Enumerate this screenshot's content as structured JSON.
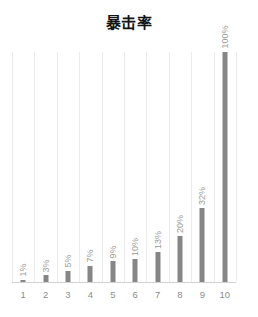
{
  "chart_data": {
    "type": "bar",
    "title": "暴击率",
    "xlabel": "",
    "ylabel": "",
    "categories": [
      "1",
      "2",
      "3",
      "4",
      "5",
      "6",
      "7",
      "8",
      "9",
      "10"
    ],
    "values": [
      1,
      3,
      5,
      7,
      9,
      10,
      13,
      20,
      32,
      100
    ],
    "data_labels": [
      "1%",
      "3%",
      "5%",
      "7%",
      "9%",
      "10%",
      "13%",
      "20%",
      "32%",
      "100%"
    ],
    "ylim": [
      0,
      100
    ],
    "grid": "vertical",
    "legend": "none",
    "bar_color": "#868686",
    "gridline_color": "#ebebeb",
    "label_color": "#9a9a9a",
    "tick_color": "#8d8d8d",
    "title_color": "#151515",
    "background_color": "#ffffff"
  }
}
